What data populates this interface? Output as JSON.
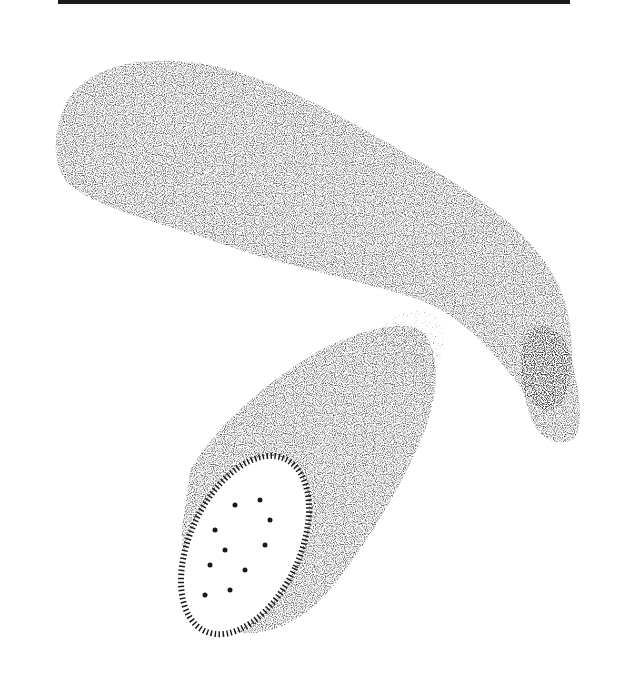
{
  "image": {
    "subject": "Stippled ink illustration of a whole zucchini and a cut zucchini piece showing its cross-section",
    "colors": {
      "ink": "#1a1a1a",
      "paper": "#ffffff"
    }
  }
}
